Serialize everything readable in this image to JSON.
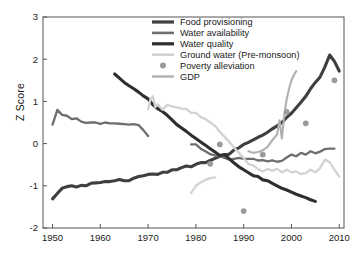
{
  "chart_data": {
    "type": "line",
    "title": "",
    "xlabel": "",
    "ylabel": "Z Score",
    "xlim": [
      1948,
      2011
    ],
    "ylim": [
      -2,
      3
    ],
    "xticks": [
      1950,
      1960,
      1970,
      1980,
      1990,
      2000,
      2010
    ],
    "yticks": [
      -2,
      -1,
      0,
      1,
      2,
      3
    ],
    "grid": false,
    "legend_position": "top-center",
    "legend": [
      {
        "label": "Food provisioning",
        "color": "#3f3f3f",
        "marker": "line",
        "width": 3.2
      },
      {
        "label": "Water availability",
        "color": "#6e6e6e",
        "marker": "line",
        "width": 2.6
      },
      {
        "label": "Water quality",
        "color": "#2e2e2e",
        "marker": "line",
        "width": 3.2
      },
      {
        "label": "Ground water (Pre-monsoon)",
        "color": "#d2d2d2",
        "marker": "line",
        "width": 2.6
      },
      {
        "label": "Poverty alleviation",
        "color": "#9a9a9a",
        "marker": "circle",
        "width": 0
      },
      {
        "label": "GDP",
        "color": "#b0b0b0",
        "marker": "line",
        "width": 2.4
      }
    ],
    "series": [
      {
        "name": "Food provisioning",
        "color": "#3f3f3f",
        "type": "line",
        "points": [
          [
            1950,
            -1.31
          ],
          [
            1951,
            -1.18
          ],
          [
            1952,
            -1.06
          ],
          [
            1953,
            -1.02
          ],
          [
            1954,
            -1.0
          ],
          [
            1955,
            -1.03
          ],
          [
            1956,
            -0.99
          ],
          [
            1957,
            -1.0
          ],
          [
            1958,
            -0.94
          ],
          [
            1959,
            -0.93
          ],
          [
            1960,
            -0.92
          ],
          [
            1961,
            -0.9
          ],
          [
            1962,
            -0.9
          ],
          [
            1963,
            -0.88
          ],
          [
            1964,
            -0.85
          ],
          [
            1965,
            -0.88
          ],
          [
            1966,
            -0.88
          ],
          [
            1967,
            -0.82
          ],
          [
            1968,
            -0.78
          ],
          [
            1969,
            -0.76
          ],
          [
            1970,
            -0.73
          ],
          [
            1971,
            -0.72
          ],
          [
            1972,
            -0.73
          ],
          [
            1973,
            -0.68
          ],
          [
            1974,
            -0.68
          ],
          [
            1975,
            -0.62
          ],
          [
            1976,
            -0.62
          ],
          [
            1977,
            -0.57
          ],
          [
            1978,
            -0.53
          ],
          [
            1979,
            -0.55
          ],
          [
            1980,
            -0.49
          ],
          [
            1981,
            -0.45
          ],
          [
            1982,
            -0.45
          ],
          [
            1983,
            -0.4
          ],
          [
            1984,
            -0.35
          ],
          [
            1985,
            -0.3
          ],
          [
            1986,
            -0.27
          ],
          [
            1987,
            -0.25
          ],
          [
            1988,
            -0.15
          ],
          [
            1989,
            -0.1
          ],
          [
            1990,
            -0.02
          ],
          [
            1991,
            0.03
          ],
          [
            1992,
            0.09
          ],
          [
            1993,
            0.15
          ],
          [
            1994,
            0.2
          ],
          [
            1995,
            0.27
          ],
          [
            1996,
            0.35
          ],
          [
            1997,
            0.42
          ],
          [
            1998,
            0.5
          ],
          [
            1999,
            0.62
          ],
          [
            2000,
            0.72
          ],
          [
            2001,
            0.85
          ],
          [
            2002,
            0.98
          ],
          [
            2003,
            1.12
          ],
          [
            2004,
            1.3
          ],
          [
            2005,
            1.45
          ],
          [
            2006,
            1.58
          ],
          [
            2007,
            1.82
          ],
          [
            2008,
            2.1
          ],
          [
            2009,
            1.95
          ],
          [
            2010,
            1.72
          ]
        ]
      },
      {
        "name": "Water availability",
        "color": "#6e6e6e",
        "type": "line",
        "points": [
          [
            1950,
            0.45
          ],
          [
            1951,
            0.8
          ],
          [
            1952,
            0.68
          ],
          [
            1953,
            0.66
          ],
          [
            1954,
            0.58
          ],
          [
            1955,
            0.6
          ],
          [
            1956,
            0.52
          ],
          [
            1957,
            0.49
          ],
          [
            1958,
            0.5
          ],
          [
            1959,
            0.5
          ],
          [
            1960,
            0.47
          ],
          [
            1961,
            0.5
          ],
          [
            1962,
            0.48
          ],
          [
            1963,
            0.48
          ],
          [
            1964,
            0.47
          ],
          [
            1965,
            0.46
          ],
          [
            1966,
            0.45
          ],
          [
            1967,
            0.46
          ],
          [
            1968,
            0.44
          ],
          [
            1969,
            0.32
          ],
          [
            1970,
            0.18
          ]
        ]
      },
      {
        "name": "Water availability (segment 2)",
        "color": "#6e6e6e",
        "type": "line",
        "points": [
          [
            1979,
            -0.02
          ],
          [
            1980,
            -0.02
          ],
          [
            1981,
            -0.12
          ],
          [
            1982,
            -0.18
          ],
          [
            1983,
            -0.25
          ],
          [
            1984,
            -0.28
          ],
          [
            1985,
            -0.3
          ],
          [
            1986,
            -0.34
          ],
          [
            1987,
            -0.38
          ],
          [
            1988,
            -0.36
          ],
          [
            1989,
            -0.34
          ],
          [
            1990,
            -0.36
          ],
          [
            1991,
            -0.36
          ],
          [
            1992,
            -0.36
          ],
          [
            1993,
            -0.4
          ],
          [
            1994,
            -0.39
          ],
          [
            1995,
            -0.42
          ],
          [
            1996,
            -0.4
          ],
          [
            1997,
            -0.43
          ],
          [
            1998,
            -0.41
          ],
          [
            1999,
            -0.33
          ],
          [
            2000,
            -0.26
          ],
          [
            2001,
            -0.3
          ],
          [
            2002,
            -0.22
          ],
          [
            2003,
            -0.26
          ],
          [
            2004,
            -0.18
          ],
          [
            2005,
            -0.23
          ],
          [
            2006,
            -0.19
          ],
          [
            2007,
            -0.13
          ],
          [
            2008,
            -0.12
          ],
          [
            2009,
            -0.12
          ]
        ]
      },
      {
        "name": "Water quality",
        "color": "#2e2e2e",
        "type": "line",
        "points": [
          [
            1963,
            1.65
          ],
          [
            1964,
            1.55
          ],
          [
            1965,
            1.45
          ],
          [
            1966,
            1.37
          ],
          [
            1967,
            1.3
          ],
          [
            1968,
            1.22
          ],
          [
            1969,
            1.13
          ],
          [
            1970,
            1.06
          ],
          [
            1971,
            0.92
          ],
          [
            1972,
            0.83
          ],
          [
            1973,
            0.76
          ],
          [
            1974,
            0.67
          ],
          [
            1975,
            0.56
          ],
          [
            1976,
            0.45
          ],
          [
            1977,
            0.37
          ],
          [
            1978,
            0.29
          ],
          [
            1979,
            0.2
          ],
          [
            1980,
            0.12
          ],
          [
            1981,
            0.04
          ],
          [
            1982,
            -0.04
          ],
          [
            1983,
            -0.12
          ],
          [
            1984,
            -0.2
          ],
          [
            1985,
            -0.28
          ],
          [
            1986,
            -0.26
          ],
          [
            1987,
            -0.36
          ],
          [
            1988,
            -0.46
          ],
          [
            1989,
            -0.55
          ],
          [
            1990,
            -0.62
          ],
          [
            1991,
            -0.69
          ],
          [
            1992,
            -0.76
          ],
          [
            1993,
            -0.78
          ],
          [
            1994,
            -0.86
          ],
          [
            1995,
            -0.88
          ],
          [
            1996,
            -0.94
          ],
          [
            1997,
            -1.0
          ],
          [
            1998,
            -1.06
          ],
          [
            1999,
            -1.1
          ],
          [
            2000,
            -1.15
          ],
          [
            2001,
            -1.2
          ],
          [
            2002,
            -1.24
          ],
          [
            2003,
            -1.28
          ],
          [
            2004,
            -1.33
          ],
          [
            2005,
            -1.37
          ]
        ]
      },
      {
        "name": "Ground water (Pre-monsoon)",
        "color": "#d2d2d2",
        "type": "line",
        "points": [
          [
            1970,
            0.82
          ],
          [
            1970.5,
            1.05
          ],
          [
            1971,
            1.12
          ],
          [
            1971.5,
            0.87
          ],
          [
            1972,
            0.93
          ],
          [
            1973,
            0.8
          ],
          [
            1974,
            0.92
          ],
          [
            1975,
            0.88
          ],
          [
            1976,
            0.86
          ],
          [
            1977,
            0.83
          ],
          [
            1978,
            0.82
          ],
          [
            1979,
            0.73
          ],
          [
            1980,
            0.73
          ],
          [
            1981,
            0.63
          ],
          [
            1982,
            0.58
          ],
          [
            1983,
            0.5
          ],
          [
            1984,
            0.42
          ],
          [
            1985,
            0.28
          ],
          [
            1986,
            0.16
          ],
          [
            1987,
            0.04
          ],
          [
            1988,
            -0.1
          ],
          [
            1989,
            -0.22
          ],
          [
            1990,
            -0.34
          ],
          [
            1991,
            -0.48
          ],
          [
            1992,
            -0.52
          ],
          [
            1993,
            -0.6
          ],
          [
            1994,
            -0.66
          ],
          [
            1995,
            -0.6
          ],
          [
            1996,
            -0.64
          ],
          [
            1997,
            -0.6
          ],
          [
            1998,
            -0.68
          ],
          [
            1999,
            -0.62
          ],
          [
            2000,
            -0.68
          ],
          [
            2001,
            -0.66
          ],
          [
            2002,
            -0.72
          ],
          [
            2003,
            -0.7
          ],
          [
            2004,
            -0.62
          ],
          [
            2005,
            -0.68
          ],
          [
            2006,
            -0.58
          ],
          [
            2007,
            -0.38
          ],
          [
            2008,
            -0.44
          ],
          [
            2009,
            -0.62
          ],
          [
            2010,
            -0.78
          ]
        ]
      },
      {
        "name": "Ground water (Pre-monsoon) (segment 2)",
        "color": "#d2d2d2",
        "type": "line",
        "points": [
          [
            1979,
            -1.17
          ],
          [
            1980,
            -1.0
          ],
          [
            1981,
            -0.92
          ],
          [
            1982,
            -0.86
          ],
          [
            1983,
            -0.82
          ],
          [
            1984,
            -0.8
          ]
        ]
      },
      {
        "name": "GDP",
        "color": "#b0b0b0",
        "type": "line",
        "points": [
          [
            1991,
            -0.18
          ],
          [
            1992,
            -0.22
          ],
          [
            1993,
            -0.2
          ],
          [
            1994,
            -0.16
          ],
          [
            1995,
            -0.08
          ],
          [
            1996,
            0.08
          ],
          [
            1997,
            0.22
          ],
          [
            1997.5,
            0.55
          ],
          [
            1998,
            0.12
          ],
          [
            1998.5,
            0.68
          ],
          [
            1999,
            1.05
          ],
          [
            1999.5,
            1.3
          ],
          [
            2000,
            1.5
          ],
          [
            2000.5,
            1.62
          ],
          [
            2001,
            1.72
          ]
        ]
      },
      {
        "name": "Poverty alleviation",
        "color": "#9a9a9a",
        "type": "scatter",
        "points": [
          [
            1983,
            -0.48
          ],
          [
            1985,
            -0.02
          ],
          [
            1990,
            -1.6
          ],
          [
            1994,
            -0.26
          ],
          [
            1999,
            0.75
          ],
          [
            2003,
            0.48
          ],
          [
            2009,
            1.5
          ]
        ]
      }
    ]
  }
}
